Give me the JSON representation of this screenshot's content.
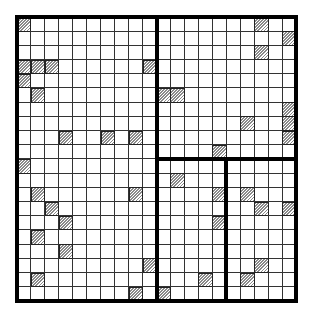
{
  "diagram": {
    "type": "grid-partition",
    "rows": 20,
    "cols": 20,
    "colors": {
      "line": "#333333",
      "thick_line": "#000000",
      "hatch": "#8a8a8a",
      "background": "#ffffff"
    },
    "hatched_cells": [
      [
        0,
        0
      ],
      [
        0,
        17
      ],
      [
        1,
        19
      ],
      [
        2,
        17
      ],
      [
        3,
        0
      ],
      [
        3,
        1
      ],
      [
        3,
        2
      ],
      [
        3,
        9
      ],
      [
        4,
        0
      ],
      [
        5,
        1
      ],
      [
        5,
        10
      ],
      [
        5,
        11
      ],
      [
        6,
        19
      ],
      [
        7,
        16
      ],
      [
        7,
        19
      ],
      [
        8,
        3
      ],
      [
        8,
        6
      ],
      [
        8,
        8
      ],
      [
        8,
        19
      ],
      [
        9,
        14
      ],
      [
        10,
        0
      ],
      [
        11,
        11
      ],
      [
        12,
        1
      ],
      [
        12,
        8
      ],
      [
        12,
        14
      ],
      [
        12,
        16
      ],
      [
        13,
        2
      ],
      [
        13,
        17
      ],
      [
        13,
        19
      ],
      [
        14,
        3
      ],
      [
        14,
        14
      ],
      [
        15,
        1
      ],
      [
        16,
        3
      ],
      [
        17,
        9
      ],
      [
        17,
        17
      ],
      [
        18,
        1
      ],
      [
        18,
        13
      ],
      [
        18,
        16
      ],
      [
        19,
        8
      ],
      [
        19,
        10
      ]
    ],
    "partitions": [
      {
        "orientation": "vertical",
        "at_col": 10,
        "from_row": 0,
        "to_row": 20
      },
      {
        "orientation": "horizontal",
        "at_row": 10,
        "from_col": 10,
        "to_col": 20
      },
      {
        "orientation": "vertical",
        "at_col": 15,
        "from_row": 10,
        "to_row": 20
      }
    ],
    "regions": [
      {
        "name": "left",
        "rows": [
          0,
          19
        ],
        "cols": [
          0,
          9
        ]
      },
      {
        "name": "top-right",
        "rows": [
          0,
          9
        ],
        "cols": [
          10,
          19
        ]
      },
      {
        "name": "bottom-right-left",
        "rows": [
          10,
          19
        ],
        "cols": [
          10,
          14
        ]
      },
      {
        "name": "bottom-right-right",
        "rows": [
          10,
          19
        ],
        "cols": [
          15,
          19
        ]
      }
    ]
  }
}
